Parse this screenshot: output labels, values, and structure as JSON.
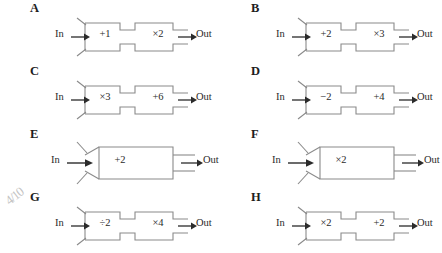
{
  "worksheet": {
    "title": "Function machine diagrams A-H",
    "stroke_color": "#8a8a8a",
    "arrow_color": "#2b2b2b",
    "text_color": "#2b2b2b",
    "background": "#ffffff",
    "in_label": "In",
    "out_label": "Out",
    "annotation": "4/10",
    "panels": [
      {
        "letter": "A",
        "layout": "double",
        "ops": [
          "+1",
          "×2"
        ],
        "in_label": "In",
        "out_label": "Out"
      },
      {
        "letter": "B",
        "layout": "double",
        "ops": [
          "+2",
          "×3"
        ],
        "in_label": "In",
        "out_label": "Out"
      },
      {
        "letter": "C",
        "layout": "double",
        "ops": [
          "×3",
          "+6"
        ],
        "in_label": "In",
        "out_label": "Out"
      },
      {
        "letter": "D",
        "layout": "double",
        "ops": [
          "−2",
          "+4"
        ],
        "in_label": "In",
        "out_label": "Out"
      },
      {
        "letter": "E",
        "layout": "single",
        "ops": [
          "+2"
        ],
        "in_label": "In",
        "out_label": "Out"
      },
      {
        "letter": "F",
        "layout": "single",
        "ops": [
          "×2"
        ],
        "in_label": "In",
        "out_label": "Out"
      },
      {
        "letter": "G",
        "layout": "double",
        "ops": [
          "÷2",
          "×4"
        ],
        "in_label": "In",
        "out_label": "Out"
      },
      {
        "letter": "H",
        "layout": "double",
        "ops": [
          "×2",
          "+2"
        ],
        "in_label": "In",
        "out_label": "Out"
      }
    ]
  }
}
